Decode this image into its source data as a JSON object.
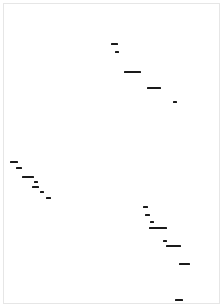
{
  "document": {
    "fragments": [
      {
        "id": "f1",
        "label": "Text fragment 1",
        "x": 111,
        "y": 43,
        "w": 7
      },
      {
        "id": "f2",
        "label": "Text fragment 2",
        "x": 115,
        "y": 51,
        "w": 4
      },
      {
        "id": "f3",
        "label": "Text fragment 3",
        "x": 124,
        "y": 71,
        "w": 17
      },
      {
        "id": "f4",
        "label": "Text fragment 4",
        "x": 147,
        "y": 87,
        "w": 14
      },
      {
        "id": "f5",
        "label": "Text fragment 5",
        "x": 173,
        "y": 101,
        "w": 4
      },
      {
        "id": "f6",
        "label": "Text fragment 6",
        "x": 10,
        "y": 161,
        "w": 8
      },
      {
        "id": "f7",
        "label": "Text fragment 7",
        "x": 16,
        "y": 167,
        "w": 6
      },
      {
        "id": "f8",
        "label": "Text fragment 8",
        "x": 22,
        "y": 176,
        "w": 12
      },
      {
        "id": "f9",
        "label": "Text fragment 9",
        "x": 34,
        "y": 181,
        "w": 4
      },
      {
        "id": "f10",
        "label": "Text fragment 10",
        "x": 32,
        "y": 186,
        "w": 7
      },
      {
        "id": "f11",
        "label": "Text fragment 11",
        "x": 40,
        "y": 191,
        "w": 4
      },
      {
        "id": "f12",
        "label": "Text fragment 12",
        "x": 46,
        "y": 197,
        "w": 5
      },
      {
        "id": "f13",
        "label": "Text fragment 13",
        "x": 143,
        "y": 206,
        "w": 5
      },
      {
        "id": "f14",
        "label": "Text fragment 14",
        "x": 145,
        "y": 214,
        "w": 5
      },
      {
        "id": "f15",
        "label": "Text fragment 15",
        "x": 150,
        "y": 221,
        "w": 4
      },
      {
        "id": "f16",
        "label": "Text fragment 16",
        "x": 149,
        "y": 227,
        "w": 18
      },
      {
        "id": "f17",
        "label": "Text fragment 17",
        "x": 163,
        "y": 240,
        "w": 4
      },
      {
        "id": "f18",
        "label": "Text fragment 18",
        "x": 166,
        "y": 245,
        "w": 15
      },
      {
        "id": "f19",
        "label": "Text fragment 19",
        "x": 179,
        "y": 263,
        "w": 11
      },
      {
        "id": "f20",
        "label": "Text fragment 20",
        "x": 175,
        "y": 299,
        "w": 8
      }
    ]
  }
}
